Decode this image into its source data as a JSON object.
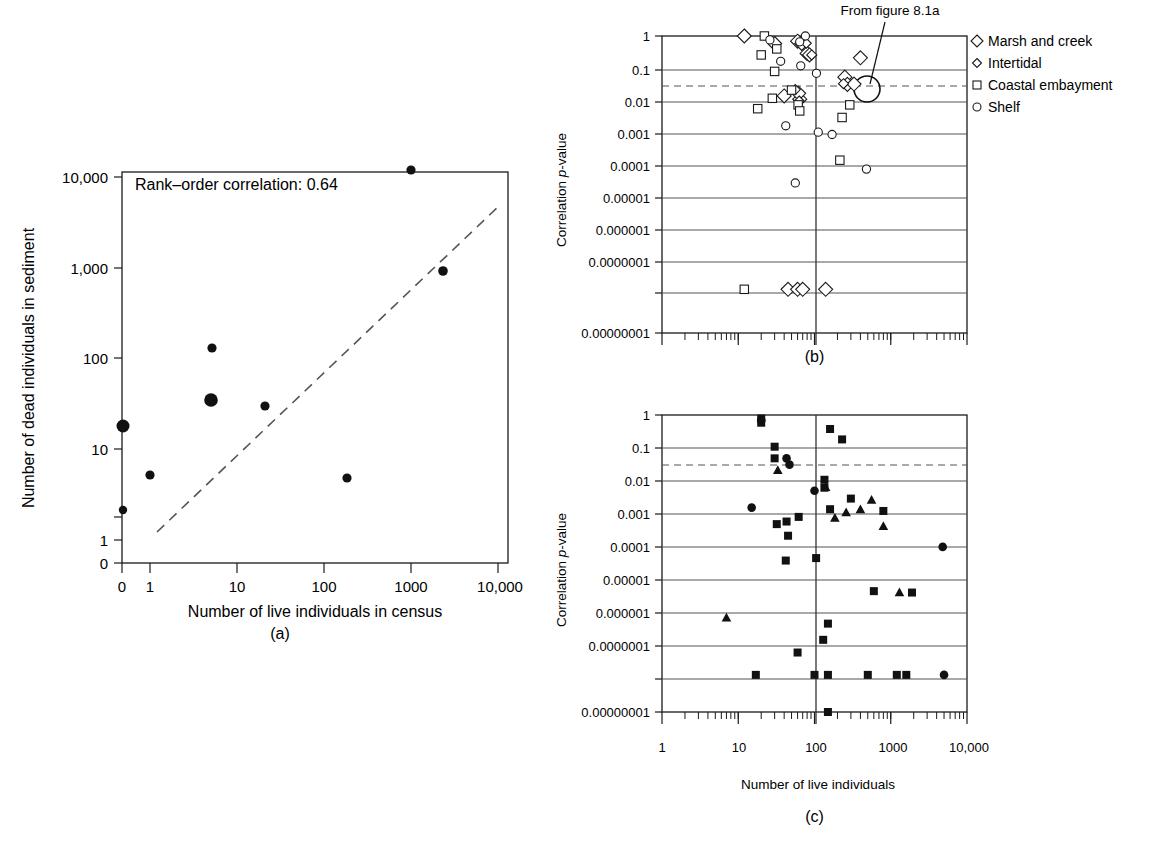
{
  "figure": {
    "panel_a_label": "(a)",
    "panel_b_label": "(b)",
    "panel_c_label": "(c)"
  },
  "panel_a": {
    "annotation": "Rank–order correlation: 0.64",
    "xlabel": "Number of live individuals in census",
    "ylabel": "Number of dead individuals in sediment",
    "xticks": [
      "0",
      "1",
      "10",
      "100",
      "1000",
      "10,000"
    ],
    "yticks": [
      "10,000",
      "1,000",
      "100",
      "10",
      "1",
      "0"
    ]
  },
  "panel_b": {
    "ylabel_prefix": "Correlation ",
    "ylabel_italic": "p",
    "ylabel_suffix": "-value",
    "yticks": [
      "1",
      "0.1",
      "0.01",
      "0.001",
      "0.0001",
      "0.00001",
      "0.000001",
      "0.0000001",
      "0.00000001"
    ],
    "annotation": "From figure 8.1a",
    "legend": [
      {
        "label": "Marsh and creek",
        "marker": "diamond-large"
      },
      {
        "label": "Intertidal",
        "marker": "diamond-small"
      },
      {
        "label": "Coastal embayment",
        "marker": "square-open"
      },
      {
        "label": "Shelf",
        "marker": "circle-open"
      }
    ]
  },
  "panel_c": {
    "ylabel_prefix": "Correlation ",
    "ylabel_italic": "p",
    "ylabel_suffix": "-value",
    "xlabel": "Number of live individuals",
    "yticks": [
      "1",
      "0.1",
      "0.01",
      "0.001",
      "0.0001",
      "0.00001",
      "0.000001",
      "0.0000001",
      "0.00000001"
    ],
    "xticks": [
      "1",
      "10",
      "100",
      "1000",
      "10,000"
    ]
  },
  "chart_data": [
    {
      "panel": "a",
      "type": "scatter",
      "title": "",
      "xlabel": "Number of live individuals in census",
      "ylabel": "Number of dead individuals in sediment",
      "xscale": "log (with 0 offset category)",
      "yscale": "log (with 0 offset category)",
      "xlim": [
        0,
        10000
      ],
      "ylim": [
        0,
        10000
      ],
      "grid": false,
      "annotations": [
        "Rank–order correlation: 0.64"
      ],
      "rank_order_correlation": 0.64,
      "points": [
        {
          "x": 0,
          "y": 15,
          "size": "large"
        },
        {
          "x": 0,
          "y": 2.2,
          "size": "small"
        },
        {
          "x": 1,
          "y": 5.0,
          "size": "small"
        },
        {
          "x": 5,
          "y": 130,
          "size": "small"
        },
        {
          "x": 5,
          "y": 35,
          "size": "large"
        },
        {
          "x": 20,
          "y": 30,
          "size": "small"
        },
        {
          "x": 200,
          "y": 4.8,
          "size": "small"
        },
        {
          "x": 1000,
          "y": 13000,
          "size": "small"
        },
        {
          "x": 2300,
          "y": 950,
          "size": "small"
        }
      ],
      "trendline": {
        "style": "dashed",
        "x_from": 1.3,
        "y_from": 2.4,
        "x_to": 9000,
        "y_to": 5200
      }
    },
    {
      "panel": "b",
      "type": "scatter",
      "title": "",
      "xlabel": "",
      "ylabel": "Correlation p-value",
      "xscale": "log",
      "yscale": "log",
      "ylim": [
        1e-08,
        1
      ],
      "grid": true,
      "significance_line": 0.05,
      "reference_vline_x": 100,
      "annotations": [
        "From figure 8.1a"
      ],
      "series": [
        {
          "name": "Marsh and creek",
          "marker": "diamond-large",
          "points": [
            [
              12,
              1.0
            ],
            [
              30,
              0.62
            ],
            [
              60,
              0.72
            ],
            [
              68,
              0.62
            ],
            [
              80,
              0.33
            ],
            [
              86,
              0.3
            ],
            [
              250,
              0.073
            ],
            [
              270,
              0.046
            ],
            [
              400,
              0.25
            ],
            [
              40,
              0.022
            ],
            [
              64,
              0.018
            ],
            [
              62,
              0.026
            ],
            [
              330,
              0.047
            ],
            [
              45,
              1e-07
            ],
            [
              60,
              1e-07
            ],
            [
              70,
              1e-07
            ],
            [
              140,
              1e-07
            ]
          ]
        },
        {
          "name": "Intertidal",
          "marker": "diamond-small",
          "points": [
            [
              78,
              0.63
            ],
            [
              92,
              0.3
            ],
            [
              240,
              0.048
            ],
            [
              56,
              0.033
            ],
            [
              63,
              0.016
            ]
          ]
        },
        {
          "name": "Coastal embayment",
          "marker": "square-open",
          "points": [
            [
              22,
              1.0
            ],
            [
              20,
              0.3
            ],
            [
              32,
              0.44
            ],
            [
              30,
              0.105
            ],
            [
              28,
              0.019
            ],
            [
              18,
              0.0098
            ],
            [
              50,
              0.032
            ],
            [
              61,
              0.0125
            ],
            [
              64,
              0.0085
            ],
            [
              290,
              0.0125
            ],
            [
              230,
              0.0056
            ],
            [
              215,
              0.00037
            ],
            [
              12,
              1e-07
            ]
          ]
        },
        {
          "name": "Shelf",
          "marker": "circle-open",
          "points": [
            [
              26,
              0.78
            ],
            [
              76,
              1.0
            ],
            [
              36,
              0.2
            ],
            [
              64,
              0.69
            ],
            [
              66,
              0.15
            ],
            [
              106,
              0.093
            ],
            [
              42,
              0.0033
            ],
            [
              112,
              0.0022
            ],
            [
              170,
              0.0019
            ],
            [
              480,
              0.00021
            ],
            [
              56,
              8.7e-05
            ]
          ]
        }
      ]
    },
    {
      "panel": "c",
      "type": "scatter",
      "title": "",
      "xlabel": "Number of live individuals",
      "ylabel": "Correlation p-value",
      "xscale": "log",
      "yscale": "log",
      "xlim": [
        1,
        10000
      ],
      "ylim": [
        1e-08,
        1
      ],
      "grid": true,
      "significance_line": 0.05,
      "reference_vline_x": 100,
      "series": [
        {
          "name": "squares",
          "marker": "square-solid",
          "points": [
            [
              20,
              0.8
            ],
            [
              20,
              0.62
            ],
            [
              30,
              0.14
            ],
            [
              30,
              0.068
            ],
            [
              160,
              0.42
            ],
            [
              230,
              0.22
            ],
            [
              135,
              0.018
            ],
            [
              135,
              0.011
            ],
            [
              32,
              0.00115
            ],
            [
              43,
              0.00135
            ],
            [
              62,
              0.0018
            ],
            [
              160,
              0.0029
            ],
            [
              300,
              0.0056
            ],
            [
              800,
              0.0026
            ],
            [
              45,
              0.00056
            ],
            [
              42,
              0.00012
            ],
            [
              105,
              0.00014
            ],
            [
              600,
              1.8e-05
            ],
            [
              1900,
              1.65e-05
            ],
            [
              150,
              2.4e-06
            ],
            [
              130,
              8.8e-07
            ],
            [
              60,
              4e-07
            ],
            [
              17,
              1e-07
            ],
            [
              100,
              1e-07
            ],
            [
              150,
              1e-07
            ],
            [
              500,
              1e-07
            ],
            [
              1200,
              1e-07
            ],
            [
              1600,
              1e-07
            ],
            [
              150,
              1e-08
            ]
          ]
        },
        {
          "name": "circles",
          "marker": "circle-solid",
          "points": [
            [
              20,
              0.72
            ],
            [
              43,
              0.068
            ],
            [
              47,
              0.046
            ],
            [
              15,
              0.0032
            ],
            [
              100,
              0.0091
            ],
            [
              4800,
              0.00028
            ],
            [
              5000,
              1e-07
            ]
          ]
        },
        {
          "name": "triangles",
          "marker": "triangle-solid",
          "points": [
            [
              33,
              0.033
            ],
            [
              140,
              0.0115
            ],
            [
              185,
              0.0017
            ],
            [
              260,
              0.0024
            ],
            [
              400,
              0.0029
            ],
            [
              560,
              0.0052
            ],
            [
              800,
              0.00102
            ],
            [
              1300,
              1.68e-05
            ],
            [
              7,
              3.5e-06
            ]
          ]
        }
      ]
    }
  ]
}
